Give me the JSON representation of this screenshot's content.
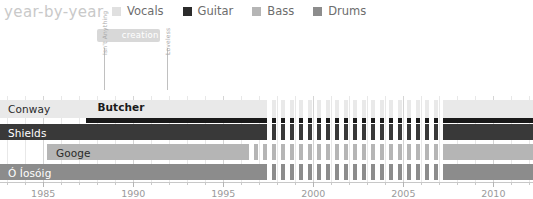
{
  "header": {
    "title": "year-by-year"
  },
  "legend": {
    "items": [
      {
        "label": "Vocals",
        "color": "#e0e0e0"
      },
      {
        "label": "Guitar",
        "color": "#2b2b2b"
      },
      {
        "label": "Bass",
        "color": "#b5b5b5"
      },
      {
        "label": "Drums",
        "color": "#8c8c8c"
      }
    ]
  },
  "annotations": {
    "span": {
      "label": "creation",
      "start": 1988.0,
      "end": 1991.5,
      "color": "#d8d8d8"
    },
    "events": [
      {
        "label": "Isn't Anything",
        "year": 1988.4
      },
      {
        "label": "Loveless",
        "year": 1991.9
      }
    ]
  },
  "chart_data": {
    "type": "bar",
    "title": "year-by-year",
    "xlabel": "",
    "ylabel": "",
    "xlim": [
      1982.6,
      2012.2
    ],
    "grid": true,
    "legend_position": "top",
    "categories": [
      "Conway",
      "Shields",
      "Googe",
      "Ó Íosóig"
    ],
    "tick_labels": [
      "1985",
      "1990",
      "1995",
      "2000",
      "2005",
      "2010"
    ],
    "tick_values": [
      1985,
      1990,
      1995,
      2000,
      2005,
      2010
    ],
    "minor_tick_step": 1,
    "hiatus": {
      "start": 1997.2,
      "end": 2007.2,
      "note": "dashed/striped period"
    },
    "series": [
      {
        "name": "Conway",
        "role": "Vocals",
        "color": "#e9e9e9",
        "row": 0,
        "segments": [
          {
            "start": 1982.6,
            "end": 1997.2,
            "style": "solid"
          },
          {
            "start": 1997.2,
            "end": 2007.2,
            "style": "striped"
          },
          {
            "start": 2007.2,
            "end": 2012.2,
            "style": "solid"
          }
        ]
      },
      {
        "name": "Butcher",
        "role": "Guitar",
        "color": "#1a1a1a",
        "row": 0,
        "sub": true,
        "segments": [
          {
            "start": 1987.4,
            "end": 1997.2,
            "style": "solid"
          },
          {
            "start": 1997.2,
            "end": 2007.2,
            "style": "striped"
          },
          {
            "start": 2007.2,
            "end": 2012.2,
            "style": "solid"
          }
        ]
      },
      {
        "name": "Shields",
        "role": "Guitar",
        "color": "#393939",
        "row": 1,
        "segments": [
          {
            "start": 1982.6,
            "end": 1997.2,
            "style": "solid"
          },
          {
            "start": 1997.2,
            "end": 2007.2,
            "style": "striped"
          },
          {
            "start": 2007.2,
            "end": 2012.2,
            "style": "solid"
          }
        ]
      },
      {
        "name": "Googe",
        "role": "Bass",
        "color": "#b5b5b5",
        "row": 2,
        "segments": [
          {
            "start": 1985.2,
            "end": 1996.2,
            "style": "solid"
          },
          {
            "start": 1996.2,
            "end": 2007.2,
            "style": "striped"
          },
          {
            "start": 2007.2,
            "end": 2012.2,
            "style": "solid"
          }
        ]
      },
      {
        "name": "Ó Íosóig",
        "role": "Drums",
        "color": "#8c8c8c",
        "row": 3,
        "segments": [
          {
            "start": 1982.6,
            "end": 1997.2,
            "style": "solid"
          },
          {
            "start": 1997.2,
            "end": 2007.2,
            "style": "striped"
          },
          {
            "start": 2007.2,
            "end": 2012.2,
            "style": "solid"
          }
        ]
      }
    ],
    "row_labels": [
      {
        "text": "Conway",
        "row": 0,
        "on": "light"
      },
      {
        "text": "Butcher",
        "row": 0,
        "on": "light",
        "offset_year": 1987.9
      },
      {
        "text": "Shields",
        "row": 1,
        "on": "dark"
      },
      {
        "text": "Googe",
        "row": 2,
        "on": "light",
        "offset_year": 1985.6
      },
      {
        "text": "Ó Íosóig",
        "row": 3,
        "on": "dark"
      }
    ]
  }
}
